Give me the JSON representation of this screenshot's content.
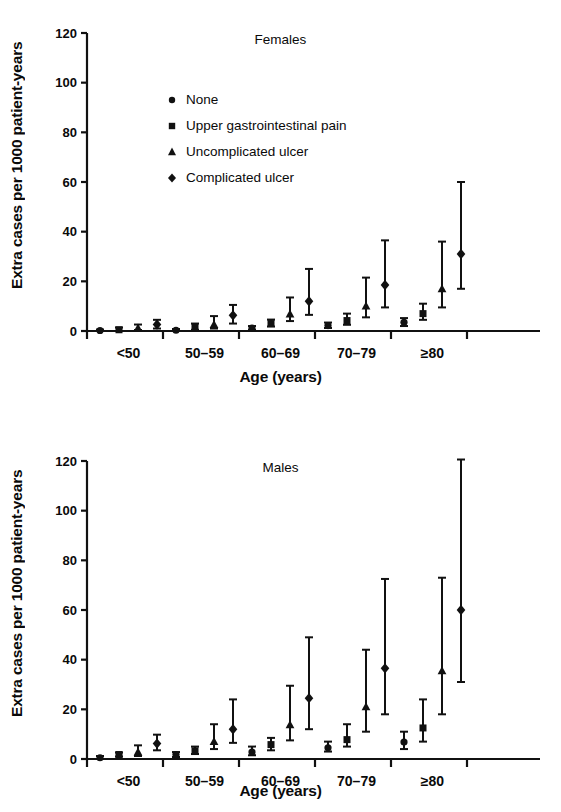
{
  "figure": {
    "axis_color": "#111111",
    "background": "#ffffff"
  },
  "axes": {
    "ylabel": "Extra cases per 1000 patient-years",
    "xlabel": "Age (years)",
    "yticks": [
      "0",
      "20",
      "40",
      "60",
      "80",
      "100",
      "120"
    ],
    "ylim": [
      0,
      120
    ],
    "xticklabels": [
      "<50",
      "50–59",
      "60–69",
      "70–79",
      "≥80"
    ]
  },
  "legend": {
    "position": "upper-left-inside",
    "items": [
      {
        "label": "None",
        "marker": "circle"
      },
      {
        "label": "Upper gastrointestinal pain",
        "marker": "square"
      },
      {
        "label": "Uncomplicated ulcer",
        "marker": "triangle"
      },
      {
        "label": "Complicated ulcer",
        "marker": "diamond"
      }
    ]
  },
  "chart_data": [
    {
      "type": "scatter",
      "title": "Females",
      "xlabel": "Age (years)",
      "ylabel": "Extra cases per 1000 patient-years",
      "ylim": [
        0,
        120
      ],
      "grid": false,
      "categories": [
        "<50",
        "50–59",
        "60–69",
        "70–79",
        "≥80"
      ],
      "series": [
        {
          "name": "None",
          "marker": "circle",
          "values": [
            0.2,
            0.3,
            1.2,
            2.2,
            3.5
          ],
          "ci_low": [
            0.0,
            0.0,
            0.5,
            1.2,
            2.0
          ],
          "ci_high": [
            0.6,
            0.8,
            2.0,
            3.4,
            5.2
          ]
        },
        {
          "name": "Upper gastrointestinal pain",
          "marker": "square",
          "values": [
            0.5,
            1.5,
            3.0,
            4.2,
            7.0
          ],
          "ci_low": [
            0.0,
            0.5,
            1.8,
            2.5,
            4.5
          ],
          "ci_high": [
            1.4,
            3.0,
            4.6,
            7.0,
            11.0
          ]
        },
        {
          "name": "Uncomplicated ulcer",
          "marker": "triangle",
          "values": [
            1.2,
            2.6,
            6.8,
            10.0,
            17.0
          ],
          "ci_low": [
            0.4,
            1.0,
            4.0,
            5.5,
            9.5
          ],
          "ci_high": [
            2.6,
            6.0,
            13.5,
            21.5,
            36.0
          ]
        },
        {
          "name": "Complicated ulcer",
          "marker": "diamond",
          "values": [
            2.6,
            6.3,
            12.0,
            18.5,
            31.0
          ],
          "ci_low": [
            1.0,
            3.0,
            6.5,
            9.5,
            17.0
          ],
          "ci_high": [
            4.5,
            10.5,
            25.0,
            36.5,
            60.0
          ]
        }
      ]
    },
    {
      "type": "scatter",
      "title": "Males",
      "xlabel": "Age (years)",
      "ylabel": "Extra cases per 1000 patient-years",
      "ylim": [
        0,
        120
      ],
      "grid": false,
      "categories": [
        "<50",
        "50–59",
        "60–69",
        "70–79",
        "≥80"
      ],
      "series": [
        {
          "name": "None",
          "marker": "circle",
          "values": [
            0.5,
            1.8,
            2.8,
            4.5,
            6.8
          ],
          "ci_low": [
            0.0,
            0.8,
            1.5,
            3.0,
            4.0
          ],
          "ci_high": [
            1.2,
            2.8,
            5.0,
            7.0,
            11.0
          ]
        },
        {
          "name": "Upper gastrointestinal pain",
          "marker": "square",
          "values": [
            1.8,
            3.3,
            5.8,
            7.8,
            12.5
          ],
          "ci_low": [
            1.0,
            2.0,
            3.5,
            5.0,
            7.0
          ],
          "ci_high": [
            2.6,
            5.0,
            8.5,
            14.0,
            24.0
          ]
        },
        {
          "name": "Uncomplicated ulcer",
          "marker": "triangle",
          "values": [
            2.8,
            7.0,
            13.8,
            21.0,
            35.5
          ],
          "ci_low": [
            1.2,
            4.0,
            7.5,
            11.0,
            18.0
          ],
          "ci_high": [
            5.5,
            14.0,
            29.5,
            44.0,
            73.0
          ]
        },
        {
          "name": "Complicated ulcer",
          "marker": "diamond",
          "values": [
            6.2,
            12.0,
            24.5,
            36.5,
            60.0
          ],
          "ci_low": [
            3.5,
            6.5,
            12.0,
            18.0,
            31.0
          ],
          "ci_high": [
            9.8,
            24.0,
            49.0,
            72.5,
            121.0
          ]
        }
      ]
    }
  ]
}
